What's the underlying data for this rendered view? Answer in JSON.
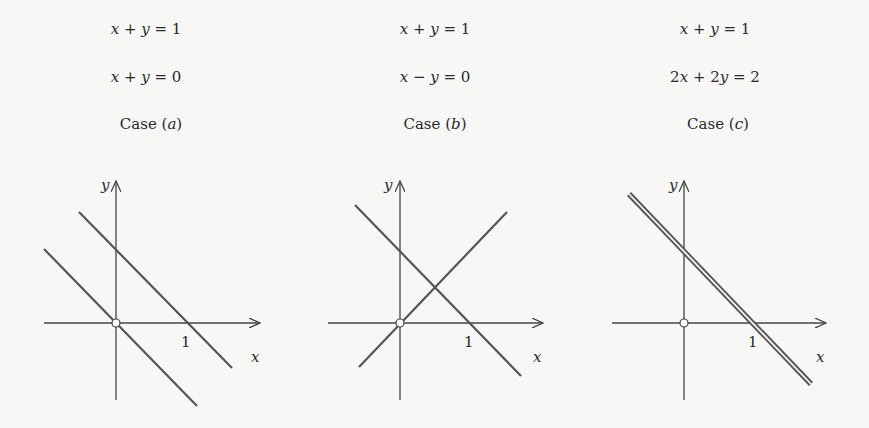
{
  "figure": {
    "cases": [
      {
        "id": "a",
        "equation_1": "x + y = 1",
        "equation_2": "x + y = 0",
        "label": "Case (a)",
        "label_prefix": "Case (",
        "label_letter": "a",
        "label_suffix": ")",
        "description": "two parallel lines, no intersection"
      },
      {
        "id": "b",
        "equation_1": "x + y = 1",
        "equation_2": "x − y = 0",
        "label": "Case (b)",
        "label_prefix": "Case (",
        "label_letter": "b",
        "label_suffix": ")",
        "description": "two lines intersecting at one point"
      },
      {
        "id": "c",
        "equation_1": "x + y = 1",
        "equation_2": "2x + 2y = 2",
        "label": "Case (c)",
        "label_prefix": "Case (",
        "label_letter": "c",
        "label_suffix": ")",
        "description": "two coincident lines"
      }
    ],
    "axes": {
      "x_label": "x",
      "y_label": "y",
      "tick_label": "1"
    },
    "colors": {
      "background": "#f7f7f6",
      "axis": "#444444",
      "line": "#555555",
      "text": "#2a2a2a"
    }
  }
}
